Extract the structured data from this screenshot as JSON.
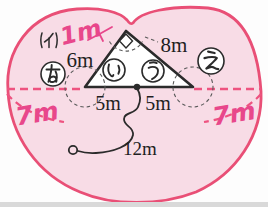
{
  "figure": {
    "type": "geometry-area-diagram",
    "caption_label": "(イ)",
    "measurements": {
      "apex_arc": "1m",
      "left_side": "6m",
      "right_side": "8m",
      "base_left": "5m",
      "base_right": "5m",
      "rope": "12m",
      "left_arc": "7m",
      "right_arc": "7m"
    },
    "regions": {
      "a": "あ",
      "i": "い",
      "u": "う",
      "e": "え"
    },
    "colors": {
      "outline_pink": "#e94f76",
      "fill_pink": "#f8dce6",
      "annotation_pink": "#e8478b",
      "dashed_pink": "#ee5380",
      "dark_line": "#2b2b2b",
      "dashed_gray": "#5a5a5a"
    }
  }
}
